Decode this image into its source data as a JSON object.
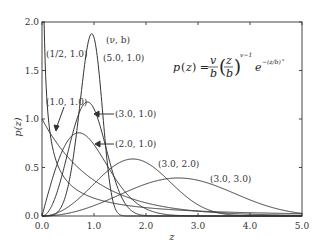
{
  "chart_data": {
    "type": "line",
    "title": "",
    "xlabel": "z",
    "ylabel": "p(z)",
    "xlim": [
      0,
      5
    ],
    "ylim": [
      0,
      2
    ],
    "xticks": [
      "0.0",
      "1.0",
      "2.0",
      "3.0",
      "4.0",
      "5.0"
    ],
    "yticks": [
      "0.0",
      "0.5",
      "1.0",
      "1.5",
      "2.0"
    ],
    "grid": false,
    "legend_header": "(ν, b)",
    "formula": {
      "lhs": "p(z) =",
      "frac_num": "v",
      "frac_den": "b",
      "inner_num": "z",
      "inner_den": "b",
      "exponent": "v−1",
      "exp": "e",
      "exp_exponent": "−(z/b)^v"
    },
    "series": [
      {
        "name": "(1/2, 1.0)",
        "nu": 0.5,
        "b": 1.0
      },
      {
        "name": "(1.0, 1.0)",
        "nu": 1.0,
        "b": 1.0
      },
      {
        "name": "(2.0, 1.0)",
        "nu": 2.0,
        "b": 1.0
      },
      {
        "name": "(3.0, 1.0)",
        "nu": 3.0,
        "b": 1.0
      },
      {
        "name": "(5.0, 1.0)",
        "nu": 5.0,
        "b": 1.0
      },
      {
        "name": "(3.0, 2.0)",
        "nu": 3.0,
        "b": 2.0
      },
      {
        "name": "(3.0, 3.0)",
        "nu": 3.0,
        "b": 3.0
      }
    ]
  },
  "labels": {
    "header": "(ν, b)",
    "s_half": "(1/2, 1.0)",
    "s_1": "(1.0, 1.0)",
    "s_2": "(2.0, 1.0)",
    "s_3": "(3.0, 1.0)",
    "s_5": "(5.0, 1.0)",
    "s_32": "(3.0, 2.0)",
    "s_33": "(3.0, 3.0)"
  }
}
